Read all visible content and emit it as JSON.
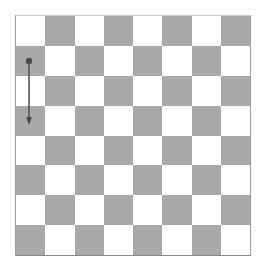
{
  "board": {
    "rows": 8,
    "cols": 8,
    "top_left_color": "light",
    "colors": {
      "light": "#ffffff",
      "dark": "#a9a9a9",
      "border": "#9a9a9a",
      "arrow": "#555555"
    },
    "pieces": []
  },
  "annotations": {
    "arrow": {
      "from_square": {
        "col": 1,
        "row": 2
      },
      "to_square": {
        "col": 1,
        "row": 4
      },
      "direction": "down",
      "start_marker": "dot",
      "end_marker": "arrowhead",
      "color": "#555555"
    }
  }
}
